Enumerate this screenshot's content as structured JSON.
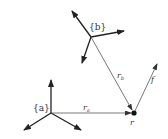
{
  "frames": [
    {
      "id": "a",
      "label": "{a}"
    },
    {
      "id": "b",
      "label": "{b}"
    }
  ],
  "vectors": {
    "r_a": {
      "symbol": "r",
      "subscript": "a"
    },
    "r_b": {
      "symbol": "r",
      "subscript": "b"
    },
    "f": {
      "symbol": "f"
    }
  },
  "point": {
    "label": "r"
  }
}
